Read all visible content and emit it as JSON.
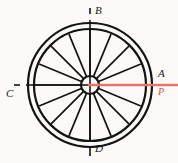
{
  "figure": {
    "background_color": "#fbfaf7",
    "ink_color": "#131313",
    "accent_color": "#e8736b",
    "accent_dark_color": "#d4504a"
  },
  "wheel": {
    "center": {
      "x": 90,
      "y": 85
    },
    "rim_outer_radius": 62,
    "rim_inner_radius": 56,
    "rim_stroke_width": 2.2,
    "hub_radius": 9,
    "hub_stroke_width": 2.2,
    "spoke_count": 16,
    "spoke_stroke_width": 1.7,
    "spoke_angles_deg": [
      0,
      22.5,
      45,
      67.5,
      90,
      112.5,
      135,
      157.5,
      180,
      202.5,
      225,
      247.5,
      270,
      292.5,
      315,
      337.5
    ]
  },
  "axes": {
    "vertical": {
      "name": "vertical-axis",
      "x": 90,
      "y_top": 8,
      "y_bottom": 156,
      "stroke_width": 1.6,
      "gap_top": [
        14,
        20
      ],
      "gap_bottom": [
        140,
        146
      ]
    },
    "horizontal": {
      "name": "horizontal-axis",
      "y": 85,
      "x_left": 14,
      "x_right": 90,
      "stroke_width": 1.6,
      "gap_left": [
        20,
        26
      ]
    }
  },
  "force_line": {
    "name": "force-line-P",
    "y": 85,
    "x_start": 88,
    "x_end": 178,
    "stroke_width": 2.4,
    "color": "#e8736b"
  },
  "labels": {
    "top": "B",
    "bottom": "D",
    "left": "C",
    "right_upper": "A",
    "right_lower": "P"
  }
}
